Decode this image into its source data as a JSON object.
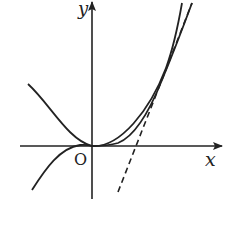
{
  "figure": {
    "type": "function-graph-diagram",
    "labels": {
      "y_axis": "y",
      "x_axis": "x",
      "origin": "O"
    },
    "curves": [
      {
        "name": "parabola",
        "style": "solid",
        "note": "convex curve, vertex at origin"
      },
      {
        "name": "cubic",
        "style": "solid",
        "note": "inflection at origin, tangent to x-axis"
      },
      {
        "name": "tangent-line",
        "style": "dashed",
        "note": "common tangent touching both curves in first quadrant"
      }
    ],
    "colors": {
      "stroke": "#222222",
      "background": "#ffffff"
    }
  }
}
